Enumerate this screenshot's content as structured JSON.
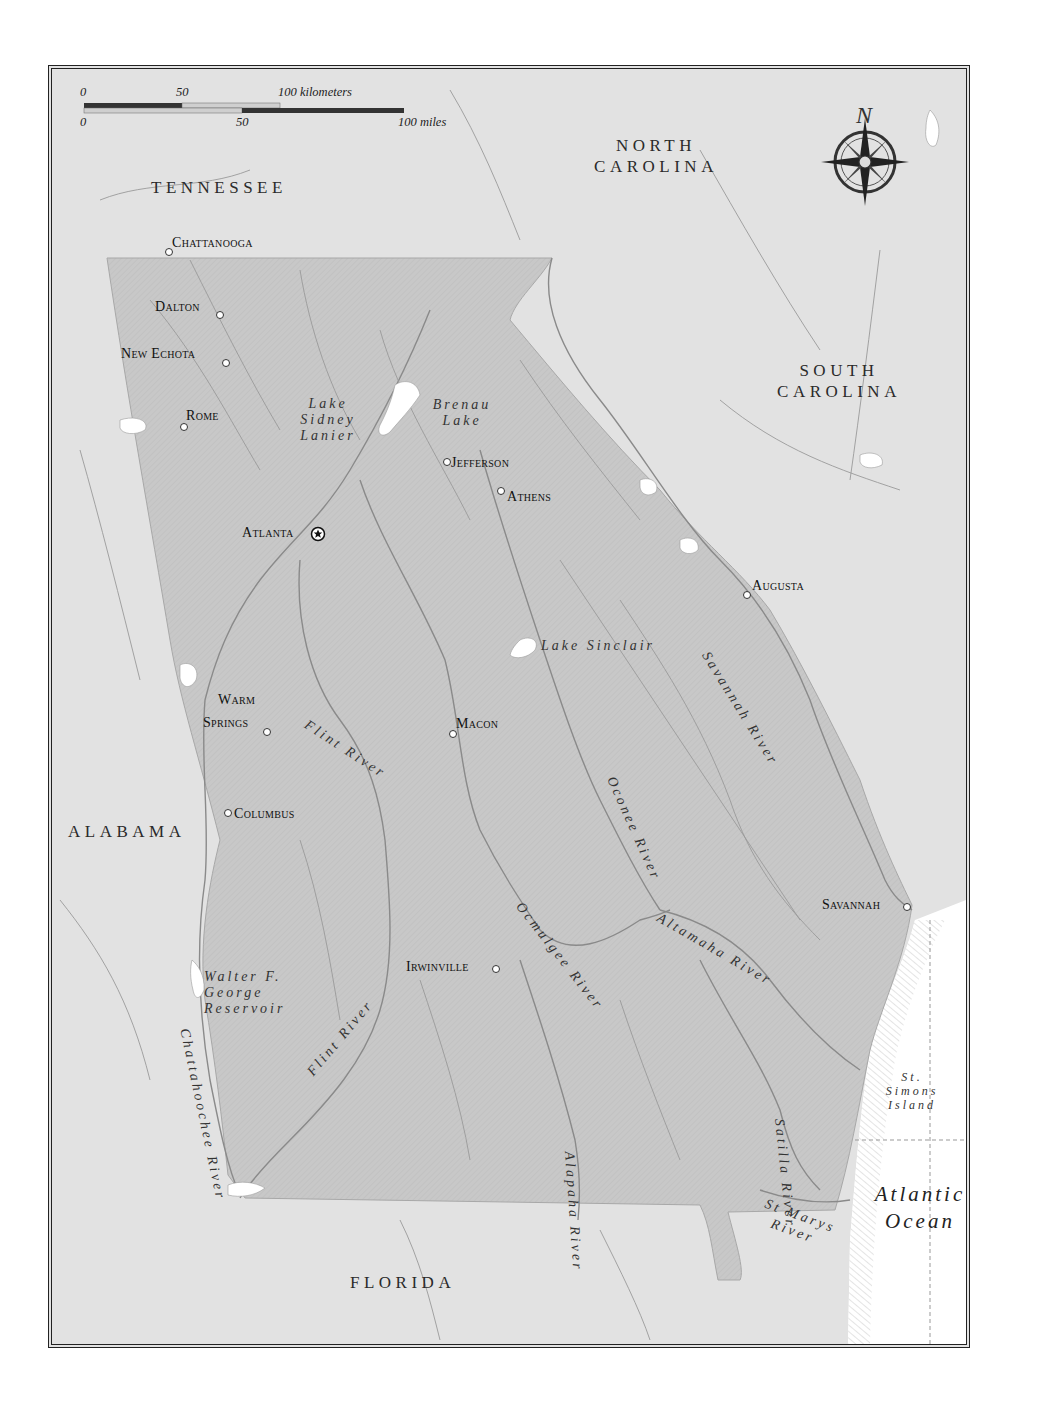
{
  "map": {
    "title_region": "Georgia",
    "colors": {
      "background_land": "#e2e2e2",
      "georgia_fill": "#c9c9c9",
      "water": "#ffffff",
      "river_line": "#8a8a8a",
      "border": "#222222",
      "label_text": "#1e1e1e"
    },
    "scale_bar": {
      "km_ticks": [
        "0",
        "50",
        "100 kilometers"
      ],
      "mile_ticks": [
        "0",
        "50",
        "100 miles"
      ]
    },
    "compass": {
      "north_label": "N"
    },
    "states": [
      {
        "id": "tennessee",
        "label": "TENNESSEE"
      },
      {
        "id": "north-carolina",
        "label_line1": "NORTH",
        "label_line2": "CAROLINA"
      },
      {
        "id": "south-carolina",
        "label_line1": "SOUTH",
        "label_line2": "CAROLINA"
      },
      {
        "id": "alabama",
        "label": "ALABAMA"
      },
      {
        "id": "florida",
        "label": "FLORIDA"
      }
    ],
    "cities": [
      {
        "id": "chattanooga",
        "label": "Chattanooga"
      },
      {
        "id": "dalton",
        "label": "Dalton"
      },
      {
        "id": "new-echota",
        "label": "New Echota"
      },
      {
        "id": "rome",
        "label": "Rome"
      },
      {
        "id": "jefferson",
        "label": "Jefferson"
      },
      {
        "id": "athens",
        "label": "Athens"
      },
      {
        "id": "atlanta",
        "label": "Atlanta",
        "capital": true
      },
      {
        "id": "augusta",
        "label": "Augusta"
      },
      {
        "id": "warm-springs",
        "label_line1": "Warm",
        "label_line2": "Springs"
      },
      {
        "id": "macon",
        "label": "Macon"
      },
      {
        "id": "columbus",
        "label": "Columbus"
      },
      {
        "id": "savannah",
        "label": "Savannah"
      },
      {
        "id": "irwinville",
        "label": "Irwinville"
      }
    ],
    "water_features": [
      {
        "id": "lake-sidney-lanier",
        "line1": "Lake",
        "line2": "Sidney",
        "line3": "Lanier"
      },
      {
        "id": "brenau-lake",
        "line1": "Brenau",
        "line2": "Lake"
      },
      {
        "id": "lake-sinclair",
        "label": "Lake Sinclair"
      },
      {
        "id": "savannah-river",
        "label": "Savannah River"
      },
      {
        "id": "flint-river-north",
        "label": "Flint River"
      },
      {
        "id": "flint-river-south",
        "label": "Flint River"
      },
      {
        "id": "oconee-river",
        "label": "Oconee River"
      },
      {
        "id": "ocmulgee-river",
        "label": "Ocmulgee River"
      },
      {
        "id": "altamaha-river",
        "label": "Altamaha River"
      },
      {
        "id": "walter-f-george-reservoir",
        "line1": "Walter F.",
        "line2": "George",
        "line3": "Reservoir"
      },
      {
        "id": "chattahoochee-river",
        "label": "Chattahoochee River"
      },
      {
        "id": "alapaha-river",
        "label": "Alapaha River"
      },
      {
        "id": "satilla-river",
        "label": "Satilla River"
      },
      {
        "id": "st-marys-river",
        "line1": "St Marys",
        "line2": "River"
      },
      {
        "id": "st-simons-island",
        "line1": "St.",
        "line2": "Simons",
        "line3": "Island"
      },
      {
        "id": "atlantic-ocean",
        "line1": "Atlantic",
        "line2": "Ocean"
      }
    ]
  }
}
